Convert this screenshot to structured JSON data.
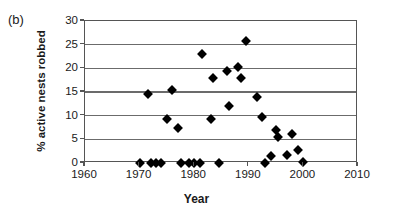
{
  "figure": {
    "panel_label": "(b)",
    "background_color": "#ffffff",
    "axis_color": "#555555",
    "grid_color": "#6b6b6b",
    "marker_color": "#000000"
  },
  "chart_data": {
    "type": "scatter",
    "title": "",
    "panel": "(b)",
    "xlabel": "Year",
    "ylabel": "% active nests robbed",
    "xlim": [
      1960,
      2010
    ],
    "ylim": [
      0,
      30
    ],
    "xticks": [
      1960,
      1970,
      1980,
      1990,
      2000,
      2010
    ],
    "yticks": [
      0,
      5,
      10,
      15,
      20,
      25,
      30
    ],
    "xtick_labels": [
      "1960",
      "1970",
      "1980",
      "1990",
      "2000",
      "2010"
    ],
    "ytick_labels": [
      "0",
      "5",
      "10",
      "15",
      "20",
      "25",
      "30"
    ],
    "grid": "horizontal",
    "legend": null,
    "marker": "filled-diamond",
    "points": [
      {
        "x": 1970.0,
        "y": 0.0
      },
      {
        "x": 1971.5,
        "y": 14.5
      },
      {
        "x": 1972.0,
        "y": 0.0
      },
      {
        "x": 1973.0,
        "y": 0.0
      },
      {
        "x": 1974.0,
        "y": 0.0
      },
      {
        "x": 1975.0,
        "y": 9.4
      },
      {
        "x": 1976.0,
        "y": 15.4
      },
      {
        "x": 1977.0,
        "y": 7.4
      },
      {
        "x": 1977.5,
        "y": 0.0
      },
      {
        "x": 1979.0,
        "y": 0.0
      },
      {
        "x": 1980.0,
        "y": 0.0
      },
      {
        "x": 1981.0,
        "y": 0.0
      },
      {
        "x": 1981.5,
        "y": 23.1
      },
      {
        "x": 1983.0,
        "y": 9.4
      },
      {
        "x": 1983.5,
        "y": 18.0
      },
      {
        "x": 1984.5,
        "y": 0.0
      },
      {
        "x": 1986.0,
        "y": 19.5
      },
      {
        "x": 1986.3,
        "y": 12.0
      },
      {
        "x": 1988.0,
        "y": 20.3
      },
      {
        "x": 1988.5,
        "y": 18.0
      },
      {
        "x": 1989.5,
        "y": 25.7
      },
      {
        "x": 1991.5,
        "y": 13.9
      },
      {
        "x": 1992.5,
        "y": 9.8
      },
      {
        "x": 1993.0,
        "y": 0.0
      },
      {
        "x": 1994.0,
        "y": 1.5
      },
      {
        "x": 1995.0,
        "y": 6.9
      },
      {
        "x": 1995.3,
        "y": 5.4
      },
      {
        "x": 1997.0,
        "y": 1.6
      },
      {
        "x": 1998.0,
        "y": 6.2
      },
      {
        "x": 1999.0,
        "y": 2.7
      },
      {
        "x": 2000.0,
        "y": 0.2
      }
    ]
  }
}
